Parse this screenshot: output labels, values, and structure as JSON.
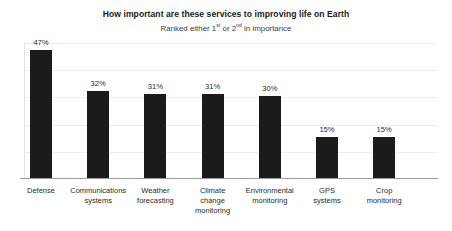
{
  "chart_data": {
    "type": "bar",
    "title": "How important are these services to improving life on Earth",
    "subtitle_parts": {
      "lead": "Ranked either 1",
      "sup1": "st",
      "mid": " or 2",
      "sup2": "nd",
      "tail": " in importance"
    },
    "subtitle": "Ranked either 1st or 2nd in importance",
    "categories": [
      "Defense",
      "Communications systems",
      "Weather forecasting",
      "Climate change monitoring",
      "Environmental monitoring",
      "GPS systems",
      "Crop monitoring"
    ],
    "category_lines": [
      [
        "Defense"
      ],
      [
        "Communications",
        "systems"
      ],
      [
        "Weather",
        "forecasting"
      ],
      [
        "Climate",
        "change",
        "monitoring"
      ],
      [
        "Environmental",
        "monitoring"
      ],
      [
        "GPS",
        "systems"
      ],
      [
        "Crop",
        "monitoring"
      ]
    ],
    "values": [
      47,
      32,
      31,
      31,
      30,
      15,
      15
    ],
    "value_labels": [
      "47%",
      "32%",
      "31%",
      "31%",
      "30%",
      "15%",
      "15%"
    ],
    "xlabel": "",
    "ylabel": "",
    "ylim": [
      0,
      50
    ],
    "grid": true,
    "grid_values": [
      10,
      20,
      30,
      40,
      50
    ],
    "legend": "none",
    "bar_color": "#1b1b1b",
    "gridline_color": "#ededed",
    "axis_color": "#9a9a9a",
    "background": "#ffffff"
  }
}
